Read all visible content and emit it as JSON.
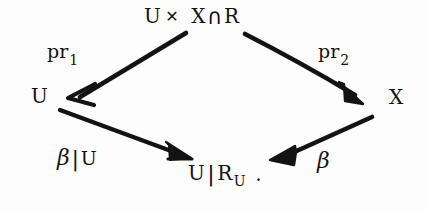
{
  "figure": {
    "kind": "commutative-diagram",
    "background_color": "#fdfdfd",
    "ink_color": "#131313",
    "width": 426,
    "height": 210
  },
  "nodes": {
    "top": {
      "id": "node-top",
      "text": "U × X ∩ R",
      "parts": {
        "left_factor": "U",
        "times_symbol": "✕",
        "right_factor": "X",
        "intersection_symbol": "∩",
        "relation": "R"
      }
    },
    "left": {
      "id": "node-left",
      "text": "U"
    },
    "right": {
      "id": "node-right",
      "text": "X"
    },
    "bottom": {
      "id": "node-bottom",
      "text": "U|R_U .",
      "parts": {
        "domain": "U",
        "bar_symbol": "|",
        "relation": "R",
        "subscript": "U",
        "period": "."
      }
    }
  },
  "edges": [
    {
      "id": "edge-pr1",
      "from": "top",
      "to": "left",
      "label": "pr",
      "label_subscript": "1",
      "arrowhead": "open-v"
    },
    {
      "id": "edge-pr2",
      "from": "top",
      "to": "right",
      "label": "pr",
      "label_subscript": "2",
      "arrowhead": "filled-triangle"
    },
    {
      "id": "edge-beta-restricted",
      "from": "left",
      "to": "bottom",
      "label_beta": "β",
      "label_bar": "|",
      "label_tail": "U",
      "arrowhead": "filled-triangle"
    },
    {
      "id": "edge-beta",
      "from": "right",
      "to": "bottom",
      "label_beta": "β",
      "arrowhead": "filled-triangle"
    }
  ],
  "labels": {
    "pr1": {
      "base": "pr",
      "sub": "1"
    },
    "pr2": {
      "base": "pr",
      "sub": "2"
    },
    "beta_restricted": {
      "beta": "β",
      "bar": "|",
      "tail": "U"
    },
    "beta": {
      "beta": "β"
    }
  }
}
